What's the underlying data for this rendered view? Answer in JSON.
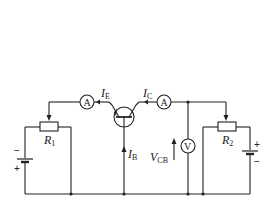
{
  "diagram": {
    "type": "common-base transistor characteristic circuit",
    "labels": {
      "ie_main": "I",
      "ie_sub": "E",
      "ic_main": "I",
      "ic_sub": "C",
      "ib_main": "I",
      "ib_sub": "B",
      "vcb_main": "V",
      "vcb_sub": "CB",
      "r1_main": "R",
      "r1_sub": "1",
      "r2_main": "R",
      "r2_sub": "2"
    },
    "meters": {
      "emitter_ammeter": "A",
      "collector_ammeter": "A",
      "voltmeter": "V"
    },
    "battery1": {
      "top_sign": "−",
      "bottom_sign": "+"
    },
    "battery2": {
      "top_sign": "+",
      "bottom_sign": "−"
    },
    "colors": {
      "line": "#222222",
      "background": "#ffffff"
    }
  }
}
